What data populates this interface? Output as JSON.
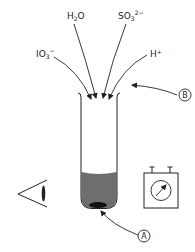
{
  "diagram": {
    "reagents": [
      {
        "id": "h2o",
        "base": "H",
        "sub": "2",
        "rest": "O",
        "sup": ""
      },
      {
        "id": "so3",
        "base": "SO",
        "sub": "3",
        "rest": "",
        "sup": "2−"
      },
      {
        "id": "io3",
        "base": "IO",
        "sub": "3",
        "rest": "",
        "sup": "−"
      },
      {
        "id": "hplus",
        "base": "H",
        "sub": "",
        "rest": "",
        "sup": "+"
      }
    ],
    "callouts": {
      "a": "A",
      "b": "B"
    },
    "objects": {
      "test_tube": "test-tube",
      "observer": "eye-icon",
      "meter": "meter-icon"
    },
    "colors": {
      "line": "#222222",
      "liquid": "#6e6e6e",
      "precipitate": "#111111"
    }
  }
}
